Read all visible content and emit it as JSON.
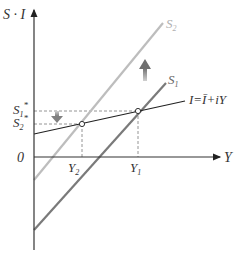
{
  "diagram": {
    "y_axis_label": "S · I",
    "x_axis_label": "Y",
    "origin_label": "0",
    "curves": [
      {
        "id": "S2",
        "label_main": "S",
        "label_sub": "2",
        "color": "#b8b8b8"
      },
      {
        "id": "S1",
        "label_main": "S",
        "label_sub": "1",
        "color": "#7a7a7a"
      },
      {
        "id": "I",
        "label": "I=Ī+iY",
        "color": "#222222"
      }
    ],
    "y_ticks": [
      {
        "main": "S",
        "sub": "1",
        "sup": "*"
      },
      {
        "main": "S",
        "sub": "2",
        "sup": "*"
      }
    ],
    "x_ticks": [
      {
        "main": "Y",
        "sub": "2"
      },
      {
        "main": "Y",
        "sub": "1"
      }
    ],
    "arrows": [
      {
        "id": "shift-up",
        "direction": "up",
        "meaning": "saving curve shifts from S1 to S2"
      },
      {
        "id": "shift-down",
        "direction": "down",
        "meaning": "equilibrium saving falls from S1* to S2*"
      }
    ],
    "accent_gray": "#8a8a8a"
  }
}
